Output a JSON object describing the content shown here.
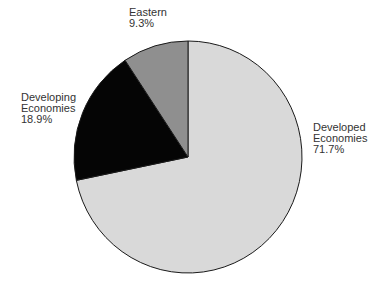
{
  "chart_data": {
    "type": "pie",
    "title": "",
    "categories": [
      "Developed Economies",
      "Developing Economies",
      "Eastern"
    ],
    "values": [
      71.7,
      18.9,
      9.3
    ],
    "slices": [
      {
        "name": "Developed Economies",
        "label_lines": [
          "Developed",
          "Economies"
        ],
        "value": 71.7,
        "value_label": "71.7%",
        "color": "#d9d9d9"
      },
      {
        "name": "Developing Economies",
        "label_lines": [
          "Developing",
          "Economies"
        ],
        "value": 18.9,
        "value_label": "18.9%",
        "color": "#050505"
      },
      {
        "name": "Eastern",
        "label_lines": [
          "Eastern"
        ],
        "value": 9.3,
        "value_label": "9.3%",
        "color": "#8f8f8f"
      }
    ],
    "start_angle": "12 o'clock",
    "direction": "clockwise",
    "legend": "none (direct labels)"
  },
  "labels": {
    "eastern": {
      "line1": "Eastern",
      "line2": "9.3%"
    },
    "developing": {
      "line1": "Developing",
      "line2": "Economies",
      "line3": "18.9%"
    },
    "developed": {
      "line1": "Developed",
      "line2": "Economies",
      "line3": "71.7%"
    }
  }
}
